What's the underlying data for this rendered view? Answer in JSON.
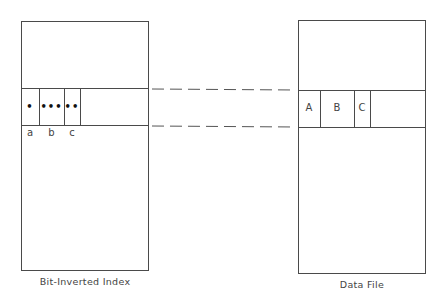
{
  "diagram": {
    "left_structure": {
      "title": "Bit-Inverted Index",
      "cells": [
        {
          "marker": "•",
          "label": "a"
        },
        {
          "marker": "•••",
          "label": "b"
        },
        {
          "marker": "••",
          "label": "c"
        }
      ]
    },
    "right_structure": {
      "title": "Data File",
      "cells": [
        {
          "label": "A"
        },
        {
          "label": "B"
        },
        {
          "label": "C"
        }
      ]
    },
    "connectors": {
      "style": "dashed",
      "count": 2
    },
    "colors": {
      "line": "#4a4a4a",
      "background": "#ffffff"
    }
  }
}
